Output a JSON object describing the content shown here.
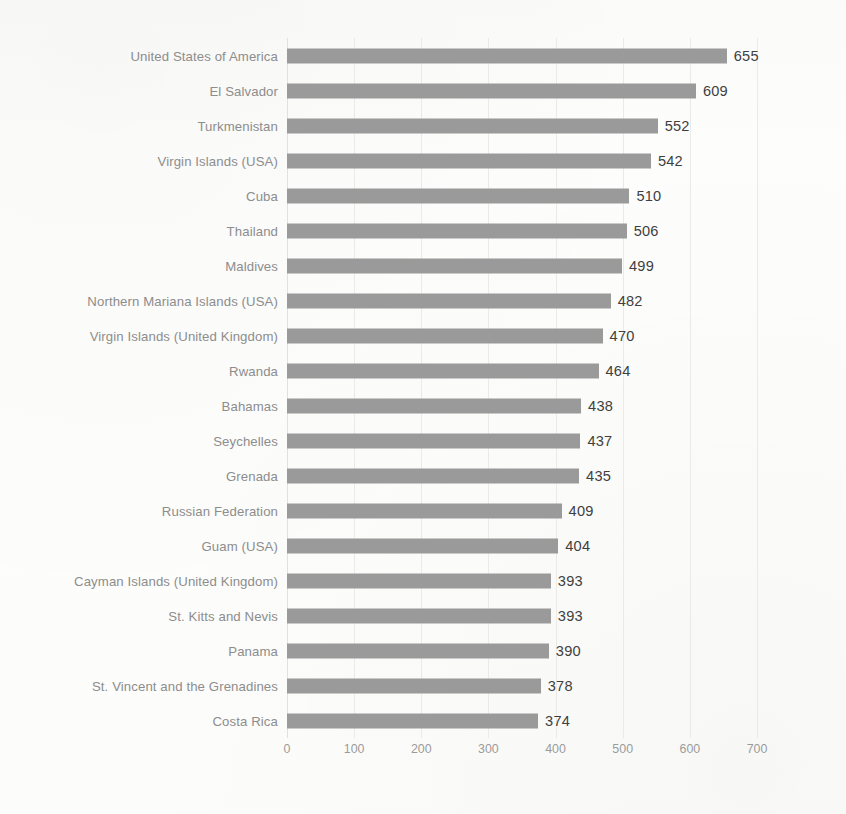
{
  "chart_data": {
    "type": "bar",
    "orientation": "horizontal",
    "title": "",
    "subtitle": "",
    "xlabel": "",
    "ylabel": "",
    "xlim": [
      0,
      700
    ],
    "xticks": [
      0,
      100,
      200,
      300,
      400,
      500,
      600,
      700
    ],
    "xtick_labels": [
      "0",
      "100",
      "200",
      "300",
      "400",
      "500",
      "600",
      "700"
    ],
    "grid": true,
    "grid_axis": "x",
    "legend": false,
    "bar_color": "#9a9a9a",
    "label_color": "#8d8d8d",
    "value_color": "#3f3f3f",
    "tick_color": "#9b9b9b",
    "background": "#fdfdfc",
    "data_labels": true,
    "categories": [
      "United States of America",
      "El Salvador",
      "Turkmenistan",
      "Virgin Islands (USA)",
      "Cuba",
      "Thailand",
      "Maldives",
      "Northern Mariana Islands (USA)",
      "Virgin Islands (United Kingdom)",
      "Rwanda",
      "Bahamas",
      "Seychelles",
      "Grenada",
      "Russian Federation",
      "Guam (USA)",
      "Cayman Islands (United Kingdom)",
      "St. Kitts and Nevis",
      "Panama",
      "St. Vincent and the Grenadines",
      "Costa Rica"
    ],
    "values": [
      655,
      609,
      552,
      542,
      510,
      506,
      499,
      482,
      470,
      464,
      438,
      437,
      435,
      409,
      404,
      393,
      393,
      390,
      378,
      374
    ],
    "value_labels": [
      "655",
      "609",
      "552",
      "542",
      "510",
      "506",
      "499",
      "482",
      "470",
      "464",
      "438",
      "437",
      "435",
      "409",
      "404",
      "393",
      "393",
      "390",
      "378",
      "374"
    ]
  }
}
